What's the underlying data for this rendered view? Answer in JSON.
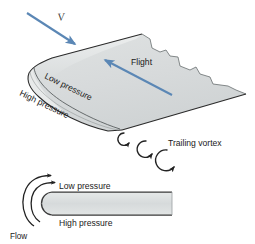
{
  "figure": {
    "background_color": "#ffffff"
  },
  "colors": {
    "arrow_blue": "#5b87b5",
    "wing_fill": "#d9dcdc",
    "wing_fill_light": "#e4e7e7",
    "outline": "#2b2b2b",
    "text": "#1a1a1a"
  },
  "upper_diagram": {
    "velocity_label": "V",
    "flight_label": "Flight",
    "low_pressure_label": "Low pressure",
    "high_pressure_label": "High pressure",
    "trailing_vortex_label": "Trailing vortex",
    "vortex_count": 3,
    "vortex_direction": "clockwise"
  },
  "lower_diagram": {
    "low_pressure_label": "Low pressure",
    "high_pressure_label": "High pressure",
    "flow_label": "Flow",
    "flow_arrow_count": 2
  }
}
